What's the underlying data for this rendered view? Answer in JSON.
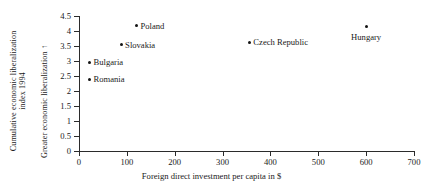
{
  "chart_data": {
    "type": "scatter",
    "title": "",
    "xlabel": "Foreign direct investment per capita in $",
    "ylabel_outer_line1": "Cumulative economic liberalization",
    "ylabel_outer_line2": "index 1994",
    "ylabel_inner": "Greater economic liberalization",
    "ylabel_inner_arrow": "↑",
    "xlim": [
      0,
      700
    ],
    "ylim": [
      0,
      4.5
    ],
    "xticks": [
      0,
      100,
      200,
      300,
      400,
      500,
      600,
      700
    ],
    "xtick_labels": [
      "0",
      "100",
      "200",
      "300",
      "400",
      "500",
      "600",
      "700"
    ],
    "yticks": [
      0,
      0.5,
      1,
      1.5,
      2,
      2.5,
      3,
      3.5,
      4,
      4.5
    ],
    "ytick_labels": [
      "0",
      "0.5",
      "1",
      "1.5",
      "2",
      "2.5",
      "3",
      "3.5",
      "4",
      "4.5"
    ],
    "grid": false,
    "legend": "none",
    "marker_color": "#141414",
    "axis_color": "#2b2b2b",
    "points": [
      {
        "label": "Poland",
        "x": 120,
        "y": 4.18,
        "label_pos": "right"
      },
      {
        "label": "Slovakia",
        "x": 88,
        "y": 3.55,
        "label_pos": "right"
      },
      {
        "label": "Bulgaria",
        "x": 22,
        "y": 2.96,
        "label_pos": "right"
      },
      {
        "label": "Romania",
        "x": 22,
        "y": 2.4,
        "label_pos": "right"
      },
      {
        "label": "Czech Republic",
        "x": 356,
        "y": 3.62,
        "label_pos": "right"
      },
      {
        "label": "Hungary",
        "x": 600,
        "y": 4.15,
        "label_pos": "below"
      }
    ]
  }
}
